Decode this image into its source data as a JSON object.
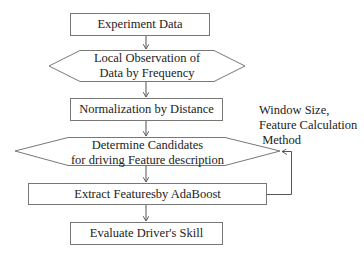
{
  "diagram": {
    "type": "flowchart",
    "nodes": [
      {
        "id": "n1",
        "shape": "rectangle",
        "lines": [
          "Experiment Data"
        ]
      },
      {
        "id": "n2",
        "shape": "hexagon",
        "lines": [
          "Local Observation of",
          "Data by Frequency"
        ]
      },
      {
        "id": "n3",
        "shape": "rectangle",
        "lines": [
          "Normalization by Distance"
        ]
      },
      {
        "id": "n4",
        "shape": "hexagon",
        "lines": [
          "Determine Candidates",
          "for driving Feature description"
        ]
      },
      {
        "id": "n5",
        "shape": "rectangle",
        "lines": [
          "Extract Featuresby AdaBoost"
        ]
      },
      {
        "id": "n6",
        "shape": "rectangle",
        "lines": [
          "Evaluate Driver's Skill"
        ]
      }
    ],
    "edges": [
      {
        "from": "n1",
        "to": "n2"
      },
      {
        "from": "n2",
        "to": "n3"
      },
      {
        "from": "n3",
        "to": "n4"
      },
      {
        "from": "n4",
        "to": "n5"
      },
      {
        "from": "n5",
        "to": "n6"
      },
      {
        "from": "n5",
        "to": "n4",
        "type": "feedback"
      }
    ],
    "annotation": {
      "lines": [
        "Window Size,",
        "Feature Calculation",
        " Method"
      ]
    },
    "colors": {
      "stroke": "#555555",
      "text": "#222222",
      "background": "#ffffff"
    }
  }
}
